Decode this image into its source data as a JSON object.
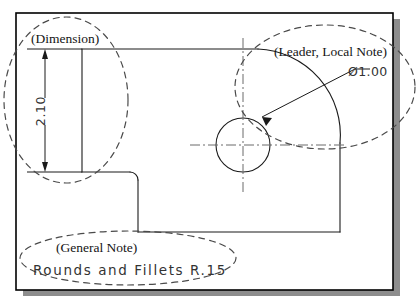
{
  "figure": {
    "kind": "engineering-drawing-annotation-example",
    "background_color": "#ffffff",
    "line_color": "#1a1a1a",
    "dashed_highlight_color": "#4a4a4a",
    "shadow_color": "#8a8a8a",
    "sheet_border_color": "#000000"
  },
  "annotations": {
    "dimension": {
      "callout_label": "(Dimension)",
      "value_text": "2.10",
      "value_rotation_degrees": -90,
      "highlight_shape": "dashed-ellipse"
    },
    "leader": {
      "callout_label": "(Leader, Local Note)",
      "value_text": "Ø1.00",
      "diameter_symbol": "Ø",
      "diameter_value": "1.00",
      "highlight_shape": "dashed-ellipse"
    },
    "general_note": {
      "callout_label": "(General Note)",
      "note_text": "Rounds and Fillets R.15",
      "highlight_shape": "dashed-ellipse"
    }
  },
  "geometry": {
    "sheet": {
      "x": 16,
      "y": 13,
      "width": 377,
      "height": 277
    },
    "shadow": {
      "offset_x": 7,
      "offset_y": 6
    },
    "part_outline_description": "L-shaped plate with filleted corners",
    "hole": {
      "center_x": 243,
      "center_y": 145,
      "radius": 27,
      "centerline_style": "dash-dot"
    },
    "dimension_line": {
      "x": 45,
      "y_top": 49,
      "y_bottom": 172,
      "arrowheads": "both-ends"
    },
    "extension_lines": [
      {
        "y": 49,
        "x_start": 27,
        "x_end": 82
      },
      {
        "y": 172,
        "x_start": 27,
        "x_end": 82
      }
    ]
  },
  "icons": {
    "arrowhead_up": "arrowhead-up-icon",
    "arrowhead_down": "arrowhead-down-icon",
    "leader_arrowhead": "leader-arrowhead-icon",
    "diameter_symbol_icon": "diameter-symbol-icon"
  }
}
